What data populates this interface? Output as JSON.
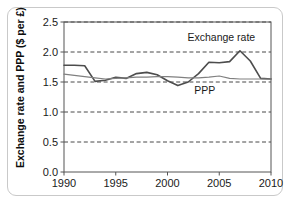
{
  "figure": {
    "border_color": "#c9c9c9",
    "background": "#ffffff"
  },
  "axis": {
    "ylabel": "Exchange rate and PPP ($ per £)",
    "ytick_labels": [
      "0.0",
      "0.5",
      "1.0",
      "1.5",
      "2.0",
      "2.5"
    ],
    "xtick_labels": [
      "1990",
      "1995",
      "2000",
      "2005",
      "2010"
    ]
  },
  "annotations": {
    "exchange_rate_label": "Exchange rate",
    "ppp_label": "PPP"
  },
  "chart_data": {
    "type": "line",
    "title": "",
    "xlabel": "",
    "ylabel": "Exchange rate and PPP ($ per £)",
    "xlim": [
      1990,
      2010
    ],
    "ylim": [
      0.0,
      2.5
    ],
    "xticks": [
      1990,
      1995,
      2000,
      2005,
      2010
    ],
    "yticks": [
      0.0,
      0.5,
      1.0,
      1.5,
      2.0,
      2.5
    ],
    "grid": "horizontal-dashed",
    "legend": "inline-annotations",
    "x": [
      1990,
      1991,
      1992,
      1993,
      1994,
      1995,
      1996,
      1997,
      1998,
      1999,
      2000,
      2001,
      2002,
      2003,
      2004,
      2005,
      2006,
      2007,
      2008,
      2009,
      2010
    ],
    "series": [
      {
        "name": "Exchange rate",
        "color": "#4d4d4d",
        "width": 1.6,
        "values": [
          1.78,
          1.78,
          1.77,
          1.51,
          1.53,
          1.58,
          1.56,
          1.64,
          1.66,
          1.62,
          1.52,
          1.44,
          1.5,
          1.64,
          1.83,
          1.82,
          1.84,
          2.02,
          1.85,
          1.56,
          1.55
        ]
      },
      {
        "name": "PPP",
        "color": "#808080",
        "width": 1.2,
        "values": [
          1.63,
          1.61,
          1.59,
          1.57,
          1.55,
          1.56,
          1.57,
          1.58,
          1.58,
          1.59,
          1.59,
          1.58,
          1.57,
          1.57,
          1.58,
          1.6,
          1.56,
          1.55,
          1.55,
          1.55,
          1.55
        ]
      }
    ],
    "annotations": [
      {
        "text": "Exchange rate",
        "x": 2005.2,
        "y": 2.18
      },
      {
        "text": "PPP",
        "x": 2003.6,
        "y": 1.3
      }
    ]
  }
}
